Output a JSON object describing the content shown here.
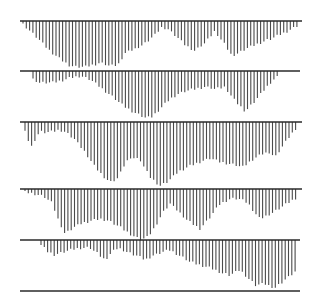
{
  "chart_data": {
    "type": "bar",
    "title": "",
    "xlabel": "",
    "ylabel": "",
    "grid": false,
    "legend": null,
    "orientation": "hanging vertical lines below horizontal baselines",
    "line_color": "#4a4a4a",
    "baseline_color": "#2a2a2a",
    "background": "#ffffff",
    "panels": [
      {
        "name": "panel-1",
        "baseline_y": 21,
        "baseline_x": [
          20,
          302
        ],
        "line_x_start": 23,
        "line_x_end": 298,
        "line_spacing": 3.3,
        "depth_keypoints": [
          [
            23,
            3
          ],
          [
            30,
            10
          ],
          [
            40,
            20
          ],
          [
            50,
            30
          ],
          [
            60,
            38
          ],
          [
            70,
            45
          ],
          [
            85,
            46
          ],
          [
            100,
            42
          ],
          [
            110,
            45
          ],
          [
            118,
            44
          ],
          [
            125,
            32
          ],
          [
            135,
            28
          ],
          [
            145,
            22
          ],
          [
            155,
            14
          ],
          [
            162,
            6
          ],
          [
            168,
            8
          ],
          [
            175,
            14
          ],
          [
            185,
            24
          ],
          [
            195,
            30
          ],
          [
            205,
            22
          ],
          [
            215,
            10
          ],
          [
            225,
            24
          ],
          [
            232,
            35
          ],
          [
            245,
            28
          ],
          [
            260,
            22
          ],
          [
            275,
            16
          ],
          [
            288,
            10
          ],
          [
            298,
            5
          ]
        ]
      },
      {
        "name": "panel-2",
        "baseline_y": 71,
        "baseline_x": [
          20,
          300
        ],
        "line_x_start": 33,
        "line_x_end": 279,
        "line_spacing": 3.3,
        "depth_keypoints": [
          [
            33,
            8
          ],
          [
            40,
            12
          ],
          [
            50,
            12
          ],
          [
            60,
            10
          ],
          [
            70,
            7
          ],
          [
            80,
            5
          ],
          [
            90,
            8
          ],
          [
            95,
            12
          ],
          [
            105,
            20
          ],
          [
            115,
            28
          ],
          [
            125,
            36
          ],
          [
            135,
            42
          ],
          [
            145,
            47
          ],
          [
            152,
            46
          ],
          [
            160,
            38
          ],
          [
            170,
            28
          ],
          [
            180,
            22
          ],
          [
            185,
            20
          ],
          [
            195,
            18
          ],
          [
            205,
            16
          ],
          [
            215,
            18
          ],
          [
            225,
            16
          ],
          [
            235,
            30
          ],
          [
            245,
            40
          ],
          [
            255,
            30
          ],
          [
            265,
            18
          ],
          [
            272,
            10
          ],
          [
            279,
            5
          ]
        ]
      },
      {
        "name": "panel-3",
        "baseline_y": 122,
        "baseline_x": [
          20,
          302
        ],
        "line_x_start": 25,
        "line_x_end": 297,
        "line_spacing": 3.3,
        "depth_keypoints": [
          [
            25,
            10
          ],
          [
            28,
            18
          ],
          [
            32,
            25
          ],
          [
            36,
            15
          ],
          [
            40,
            10
          ],
          [
            50,
            10
          ],
          [
            60,
            8
          ],
          [
            65,
            10
          ],
          [
            75,
            18
          ],
          [
            85,
            30
          ],
          [
            95,
            45
          ],
          [
            105,
            56
          ],
          [
            110,
            60
          ],
          [
            118,
            56
          ],
          [
            125,
            42
          ],
          [
            130,
            35
          ],
          [
            140,
            38
          ],
          [
            150,
            55
          ],
          [
            160,
            64
          ],
          [
            168,
            60
          ],
          [
            178,
            50
          ],
          [
            190,
            44
          ],
          [
            200,
            40
          ],
          [
            210,
            36
          ],
          [
            220,
            40
          ],
          [
            230,
            42
          ],
          [
            243,
            45
          ],
          [
            252,
            38
          ],
          [
            262,
            32
          ],
          [
            270,
            30
          ],
          [
            275,
            35
          ],
          [
            282,
            25
          ],
          [
            290,
            14
          ],
          [
            297,
            5
          ]
        ]
      },
      {
        "name": "panel-4",
        "baseline_y": 189,
        "baseline_x": [
          20,
          302
        ],
        "line_x_start": 25,
        "line_x_end": 298,
        "line_spacing": 3.3,
        "depth_keypoints": [
          [
            25,
            3
          ],
          [
            35,
            5
          ],
          [
            45,
            8
          ],
          [
            52,
            14
          ],
          [
            58,
            30
          ],
          [
            65,
            45
          ],
          [
            72,
            40
          ],
          [
            80,
            35
          ],
          [
            90,
            32
          ],
          [
            100,
            30
          ],
          [
            110,
            32
          ],
          [
            120,
            38
          ],
          [
            130,
            45
          ],
          [
            140,
            51
          ],
          [
            148,
            48
          ],
          [
            155,
            38
          ],
          [
            162,
            25
          ],
          [
            170,
            15
          ],
          [
            178,
            22
          ],
          [
            188,
            32
          ],
          [
            200,
            40
          ],
          [
            210,
            28
          ],
          [
            220,
            15
          ],
          [
            230,
            10
          ],
          [
            240,
            10
          ],
          [
            248,
            14
          ],
          [
            255,
            24
          ],
          [
            260,
            30
          ],
          [
            268,
            26
          ],
          [
            278,
            20
          ],
          [
            288,
            14
          ],
          [
            298,
            8
          ]
        ]
      },
      {
        "name": "panel-5",
        "baseline_y": 240,
        "baseline_x": [
          20,
          300
        ],
        "bottom_line_y": 291,
        "bottom_line_x": [
          20,
          300
        ],
        "line_x_start": 41,
        "line_x_end": 298,
        "line_spacing": 3.3,
        "depth_keypoints": [
          [
            41,
            5
          ],
          [
            48,
            12
          ],
          [
            55,
            15
          ],
          [
            62,
            12
          ],
          [
            70,
            10
          ],
          [
            80,
            8
          ],
          [
            90,
            8
          ],
          [
            98,
            14
          ],
          [
            105,
            20
          ],
          [
            112,
            12
          ],
          [
            118,
            8
          ],
          [
            128,
            12
          ],
          [
            138,
            16
          ],
          [
            145,
            20
          ],
          [
            152,
            16
          ],
          [
            162,
            12
          ],
          [
            170,
            10
          ],
          [
            180,
            16
          ],
          [
            190,
            22
          ],
          [
            200,
            25
          ],
          [
            210,
            28
          ],
          [
            220,
            32
          ],
          [
            230,
            35
          ],
          [
            240,
            30
          ],
          [
            248,
            38
          ],
          [
            255,
            45
          ],
          [
            265,
            44
          ],
          [
            275,
            48
          ],
          [
            283,
            42
          ],
          [
            290,
            36
          ],
          [
            298,
            30
          ]
        ]
      }
    ]
  }
}
